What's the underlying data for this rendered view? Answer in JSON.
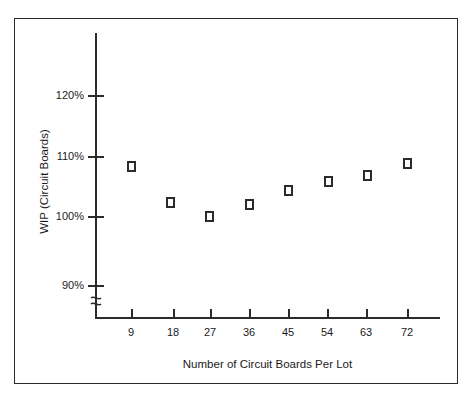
{
  "chart_data": {
    "type": "scatter",
    "title": "",
    "xlabel": "Number of Circuit Boards Per Lot",
    "ylabel": "WIP (Circuit Boards)",
    "x": [
      9,
      18,
      27,
      36,
      45,
      54,
      63,
      72
    ],
    "values": [
      108.3,
      102.2,
      100.0,
      102.0,
      104.3,
      105.8,
      106.8,
      108.8
    ],
    "xticklabels": [
      "9",
      "18",
      "27",
      "36",
      "45",
      "54",
      "63",
      "72"
    ],
    "yticklabels": [
      "120%",
      "110%",
      "100%",
      "90%"
    ],
    "yticks": [
      120,
      110,
      100,
      90
    ],
    "ylim": [
      90,
      126
    ],
    "xlim": [
      0,
      81
    ],
    "grid": false,
    "legend": null,
    "marker": "open-square",
    "axis_break": "y-axis broken below 90%",
    "series": [
      {
        "name": "WIP",
        "points": [
          {
            "x": 9,
            "y": 108.3,
            "y_label": "108%"
          },
          {
            "x": 18,
            "y": 102.2,
            "y_label": "102%"
          },
          {
            "x": 27,
            "y": 100.0,
            "y_label": "100%"
          },
          {
            "x": 36,
            "y": 102.0,
            "y_label": "102%"
          },
          {
            "x": 45,
            "y": 104.3,
            "y_label": "104%"
          },
          {
            "x": 54,
            "y": 105.8,
            "y_label": "106%"
          },
          {
            "x": 63,
            "y": 106.8,
            "y_label": "107%"
          },
          {
            "x": 72,
            "y": 108.8,
            "y_label": "109%"
          }
        ]
      }
    ],
    "colors": {
      "axis": "#2b2b2b",
      "marker_edge": "#2b2b2b",
      "marker_fill": "#ffffff",
      "frame": "#2b2b2b",
      "background": "#ffffff"
    }
  },
  "figure": {
    "x_axis_title": "Number of Circuit Boards Per Lot",
    "y_axis_title": "WIP (Circuit Boards)",
    "y_labels": {
      "t0": "120%",
      "t1": "110%",
      "t2": "100%",
      "t3": "90%"
    },
    "x_labels": {
      "t0": "9",
      "t1": "18",
      "t2": "27",
      "t3": "36",
      "t4": "45",
      "t5": "54",
      "t6": "63",
      "t7": "72"
    }
  }
}
